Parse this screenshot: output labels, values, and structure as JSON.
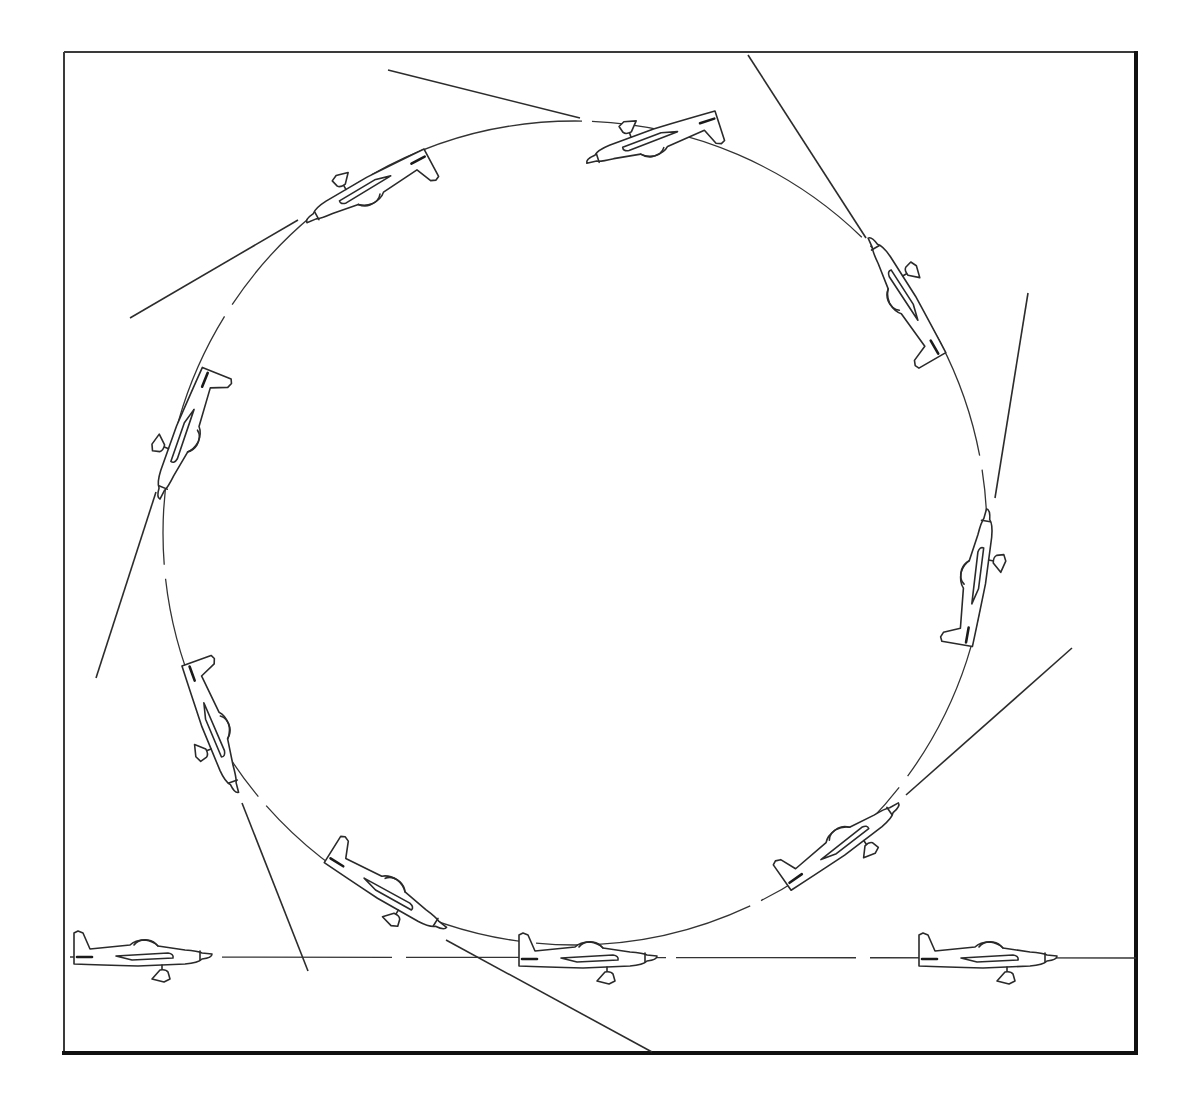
{
  "figure": {
    "frame": {
      "x": 64,
      "y": 52,
      "width": 1072,
      "height": 1002,
      "color": "#2a2a2a"
    },
    "loop": {
      "cx": 575,
      "cy": 533,
      "r": 412
    },
    "ground_line": {
      "x1": 70,
      "y1": 957,
      "x2": 1136,
      "y2": 958
    },
    "icon_names": [
      "airplane-icon"
    ],
    "planes": [
      {
        "id": "ground-entry",
        "x": 140,
        "y": 955,
        "angle": 0
      },
      {
        "id": "ground-mid",
        "x": 585,
        "y": 957,
        "angle": 0
      },
      {
        "id": "ground-exit",
        "x": 985,
        "y": 957,
        "angle": 0
      },
      {
        "id": "climb-45",
        "x": 840,
        "y": 845,
        "angle": -35
      },
      {
        "id": "vertical-up",
        "x": 975,
        "y": 580,
        "angle": -80
      },
      {
        "id": "over-the-top-start",
        "x": 905,
        "y": 300,
        "angle": -120
      },
      {
        "id": "inverted-top",
        "x": 655,
        "y": 140,
        "angle": 162
      },
      {
        "id": "inverted-descending",
        "x": 370,
        "y": 188,
        "angle": 152
      },
      {
        "id": "vertical-down",
        "x": 186,
        "y": 432,
        "angle": 112
      },
      {
        "id": "dive-recovery",
        "x": 213,
        "y": 725,
        "angle": 70
      },
      {
        "id": "pull-out",
        "x": 385,
        "y": 890,
        "angle": 32
      }
    ],
    "tangents": [
      {
        "x1": 388,
        "y1": 70,
        "x2": 580,
        "y2": 118
      },
      {
        "x1": 748,
        "y1": 55,
        "x2": 866,
        "y2": 238
      },
      {
        "x1": 1028,
        "y1": 293,
        "x2": 995,
        "y2": 498
      },
      {
        "x1": 1072,
        "y1": 648,
        "x2": 906,
        "y2": 795
      },
      {
        "x1": 130,
        "y1": 318,
        "x2": 298,
        "y2": 220
      },
      {
        "x1": 96,
        "y1": 678,
        "x2": 156,
        "y2": 492
      },
      {
        "x1": 308,
        "y1": 971,
        "x2": 242,
        "y2": 803
      },
      {
        "x1": 652,
        "y1": 1052,
        "x2": 446,
        "y2": 940
      }
    ]
  }
}
